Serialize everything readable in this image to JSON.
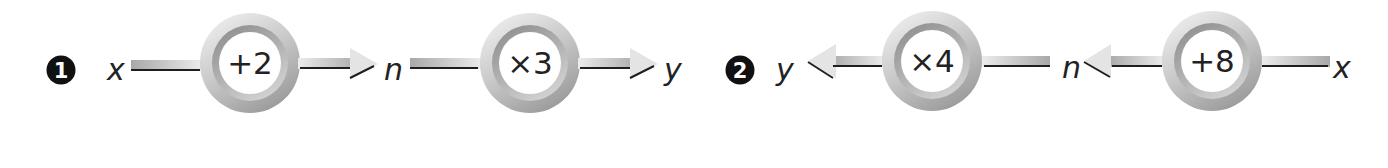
{
  "diagram": {
    "type": "function-machines",
    "accent": {
      "ring_dark": "#8f8f8f",
      "ring_light": "#e6e6e6",
      "bar_dark": "#a8a8a8",
      "bar_light": "#ececec",
      "line": "#1e1e1e",
      "badge": "#111111"
    },
    "problems": [
      {
        "number": "1",
        "direction": "left-to-right",
        "input": "x",
        "steps": [
          {
            "operation": "+2",
            "output": "n"
          },
          {
            "operation": "×3",
            "output": "y"
          }
        ]
      },
      {
        "number": "2",
        "direction": "right-to-left",
        "input": "x",
        "steps": [
          {
            "operation": "+8",
            "output": "n"
          },
          {
            "operation": "×4",
            "output": "y"
          }
        ]
      }
    ]
  }
}
